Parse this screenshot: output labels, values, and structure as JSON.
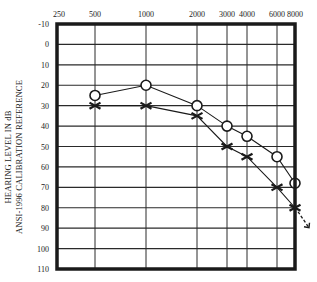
{
  "chart_data": {
    "type": "line",
    "title": "",
    "chart_kind": "audiogram",
    "xlabel": "Frequency (Hz)",
    "ylabel": [
      "HEARING LEVEL IN dB",
      "ANSI-1996 CALIBRATION REFERENCE"
    ],
    "x_tick_labels": [
      "250",
      "500",
      "1000",
      "2000",
      "3000",
      "4000",
      "6000",
      "8000"
    ],
    "y_tick_labels": [
      "-10",
      "0",
      "10",
      "20",
      "30",
      "40",
      "50",
      "60",
      "70",
      "80",
      "90",
      "100",
      "110"
    ],
    "ylim": [
      -10,
      110
    ],
    "y_inverted": true,
    "grid": true,
    "legend": null,
    "series": [
      {
        "name": "Circles (O)",
        "marker": "circle",
        "x": [
          "500",
          "1000",
          "2000",
          "3000",
          "4000",
          "6000",
          "8000"
        ],
        "values": [
          25,
          20,
          30,
          40,
          45,
          55,
          68
        ]
      },
      {
        "name": "Crosses (X)",
        "marker": "x",
        "x": [
          "500",
          "1000",
          "2000",
          "3000",
          "4000",
          "6000",
          "8000"
        ],
        "values": [
          30,
          30,
          35,
          50,
          55,
          70,
          80
        ],
        "no_response_arrow_at": "8000"
      }
    ]
  },
  "layout": {
    "x_px": {
      "250": 57,
      "500": 95,
      "1000": 146,
      "2000": 197,
      "3000": 227,
      "4000": 247,
      "6000": 277,
      "8000": 295
    },
    "plot": {
      "left": 57,
      "right": 295,
      "top": 24,
      "bottom": 269
    },
    "colors": {
      "ink": "#1a1a1a",
      "grid": "#2a2a2a",
      "background": "#ffffff"
    }
  }
}
